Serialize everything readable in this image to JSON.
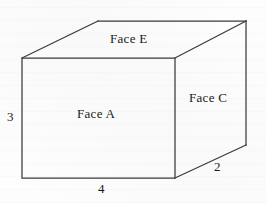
{
  "figure": {
    "type": "3d-rectangular-prism-diagram",
    "background_color": "#fdfdfd",
    "stroke_color": "#3a3a3a",
    "text_color": "#1a1a1a",
    "faces": [
      {
        "id": "face-e",
        "label": "Face E",
        "position": "top",
        "x": 110,
        "y": 32
      },
      {
        "id": "face-a",
        "label": "Face A",
        "position": "front",
        "x": 77,
        "y": 107
      },
      {
        "id": "face-c",
        "label": "Face C",
        "position": "right",
        "x": 189,
        "y": 91
      }
    ],
    "dimensions": [
      {
        "id": "height",
        "label": "3",
        "edge": "front-left-vertical",
        "x": 7,
        "y": 110
      },
      {
        "id": "width",
        "label": "4",
        "edge": "front-bottom-horizontal",
        "x": 98,
        "y": 182
      },
      {
        "id": "depth",
        "label": "2",
        "edge": "bottom-right-diagonal",
        "x": 214,
        "y": 160
      }
    ],
    "geometry": {
      "front_top_left": [
        22,
        58
      ],
      "front_top_right": [
        175,
        58
      ],
      "front_bottom_right": [
        175,
        178
      ],
      "front_bottom_left": [
        22,
        178
      ],
      "back_top_left": [
        98,
        21
      ],
      "back_top_right": [
        246,
        21
      ],
      "back_bottom_right": [
        246,
        145
      ]
    }
  }
}
